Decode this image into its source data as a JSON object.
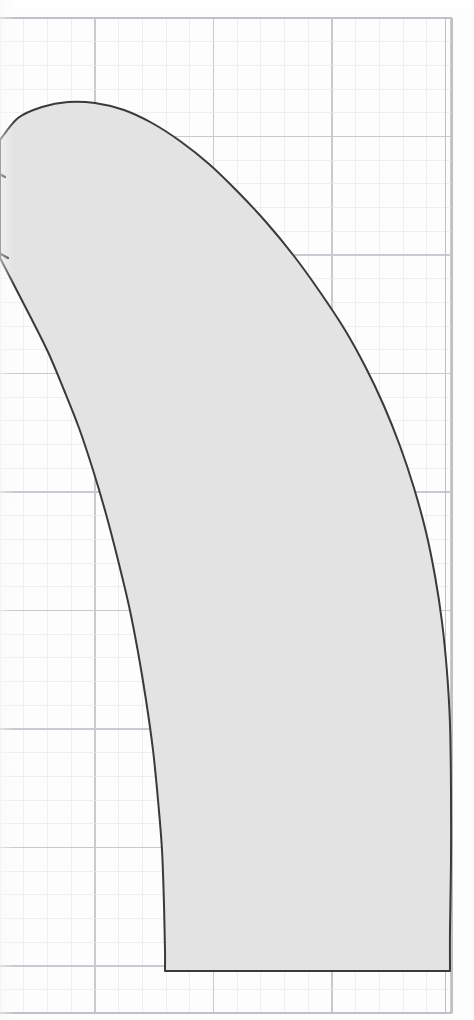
{
  "page": {
    "width": 474,
    "height": 1020,
    "background_color": "#ffffff",
    "paper_color": "#fdfdfd"
  },
  "annotations": {
    "right_edge_label": "|",
    "right_edge_label_visible_text": ""
  },
  "chart_data": {
    "type": "area",
    "title": "",
    "subtitle": "",
    "xlabel": "",
    "ylabel": "",
    "legend": [],
    "grid": {
      "visible": true,
      "minor_spacing_px": 23.7,
      "major_every_n_minor": 5,
      "minor_color": "#e9e9ec",
      "major_color": "#c9c9cf",
      "border_color": "#c0c0c6",
      "plot_left_px": 0,
      "plot_top_px": 18,
      "plot_right_px": 452,
      "plot_bottom_px": 1013,
      "major_x_px": [
        95,
        213.5,
        332,
        450.5
      ],
      "major_y_px": [
        18,
        136.5,
        255,
        373.5,
        492,
        610.5,
        729,
        847.5,
        966
      ],
      "minor_x_count": 19,
      "minor_y_count": 42
    },
    "region": {
      "name": "shaded-region",
      "fill_color": "#e3e3e3",
      "stroke_color": "#3a3a3a",
      "stroke_width_px": 2.0,
      "baseline_y_px": 971,
      "baseline_x_start_px": 165,
      "baseline_x_end_px": 450,
      "peak_point_px": [
        95,
        103
      ],
      "left_cusps_px": [
        [
          0,
          175
        ],
        [
          3,
          256
        ]
      ],
      "upper_boundary_points_px": [
        [
          0,
          140
        ],
        [
          18,
          118
        ],
        [
          42,
          107
        ],
        [
          68,
          102
        ],
        [
          95,
          103
        ],
        [
          124,
          110
        ],
        [
          152,
          123
        ],
        [
          180,
          141
        ],
        [
          209,
          164
        ],
        [
          238,
          192
        ],
        [
          266,
          222
        ],
        [
          294,
          256
        ],
        [
          320,
          292
        ],
        [
          345,
          330
        ],
        [
          366,
          368
        ],
        [
          384,
          406
        ],
        [
          400,
          446
        ],
        [
          414,
          488
        ],
        [
          426,
          532
        ],
        [
          435,
          576
        ],
        [
          442,
          622
        ],
        [
          447,
          672
        ],
        [
          450,
          724
        ],
        [
          451,
          790
        ],
        [
          451,
          860
        ],
        [
          450,
          930
        ],
        [
          450,
          971
        ]
      ],
      "left_boundary_points_px": [
        [
          0,
          258
        ],
        [
          14,
          285
        ],
        [
          30,
          316
        ],
        [
          48,
          352
        ],
        [
          64,
          390
        ],
        [
          79,
          428
        ],
        [
          93,
          470
        ],
        [
          106,
          514
        ],
        [
          118,
          560
        ],
        [
          129,
          606
        ],
        [
          138,
          652
        ],
        [
          146,
          700
        ],
        [
          153,
          750
        ],
        [
          158,
          800
        ],
        [
          162,
          850
        ],
        [
          164,
          905
        ],
        [
          165,
          950
        ],
        [
          165,
          971
        ]
      ]
    },
    "axis_ranges": {
      "x_px": [
        0,
        452
      ],
      "y_px": [
        18,
        1013
      ]
    }
  }
}
